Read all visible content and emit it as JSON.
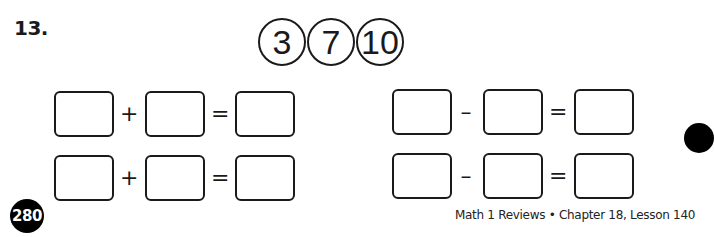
{
  "problem": {
    "number": "13.",
    "number_bank": [
      "3",
      "7",
      "10"
    ],
    "addition_rows": [
      {
        "operator": "+",
        "equals": "="
      },
      {
        "operator": "+",
        "equals": "="
      }
    ],
    "subtraction_rows": [
      {
        "operator": "–",
        "equals": "="
      },
      {
        "operator": "–",
        "equals": "="
      }
    ]
  },
  "footer": {
    "page_number": "280",
    "text": "Math 1 Reviews • Chapter 18, Lesson 140"
  },
  "colors": {
    "ink": "#1a1a1a",
    "background": "#ffffff"
  }
}
